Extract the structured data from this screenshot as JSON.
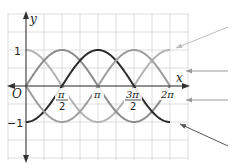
{
  "chart_data": {
    "type": "line",
    "title": "",
    "xlabel": "x",
    "ylabel": "y",
    "origin_label": "O",
    "xlim": [
      -0.7854,
      4.7124
    ],
    "ylim": [
      -2.0,
      2.0
    ],
    "grid": true,
    "legend": "none (unlabeled pointer lines at right)",
    "x_ticks": [
      {
        "value": 1.5708,
        "label_num": "π",
        "label_den": "2"
      },
      {
        "value": 3.1416,
        "label": "π"
      },
      {
        "value": 4.7124,
        "label_num": "3π",
        "label_den": "2"
      },
      {
        "value": 6.2832,
        "label": "2π"
      }
    ],
    "y_ticks": [
      {
        "value": 1,
        "label": "1"
      },
      {
        "value": -1,
        "label": "−1"
      }
    ],
    "series": [
      {
        "name": "cos x",
        "color": "#b3b3b3",
        "x_range": [
          0,
          6.2832
        ],
        "peaks_at": [
          0,
          6.2832
        ],
        "troughs_at": [
          3.1416
        ]
      },
      {
        "name": "sin x",
        "color": "#8c8c8c",
        "x_range": [
          0,
          6.2832
        ],
        "peaks_at": [
          1.5708
        ],
        "troughs_at": [
          4.7124
        ]
      },
      {
        "name": "−cos x",
        "color": "#2b2b2b",
        "x_range": [
          0,
          6.2832
        ],
        "peaks_at": [
          3.1416
        ],
        "troughs_at": [
          0,
          6.2832
        ]
      },
      {
        "name": "−sin x",
        "color": "#9e9e9e",
        "x_range": [
          0,
          6.2832
        ],
        "peaks_at": [
          4.7124
        ],
        "troughs_at": [
          1.5708
        ]
      }
    ],
    "pointers": [
      {
        "target_series": "cos x",
        "from": [
          228,
          27
        ],
        "to": [
          176,
          48
        ],
        "color": "#bdbdbd"
      },
      {
        "target_series": "sin x",
        "from": [
          228,
          71
        ],
        "to": [
          186,
          71
        ],
        "color": "#9a9a9a"
      },
      {
        "target_series": "−sin x",
        "from": [
          228,
          100
        ],
        "to": [
          186,
          100
        ],
        "color": "#9a9a9a"
      },
      {
        "target_series": "−cos x",
        "from": [
          228,
          146
        ],
        "to": [
          180,
          124
        ],
        "color": "#555555"
      }
    ]
  },
  "axes": {
    "x_label": "x",
    "y_label": "y",
    "origin": "O",
    "y_tick_1": "1",
    "y_tick_neg1": "−1",
    "x_tick_pi_over_2_num": "π",
    "x_tick_pi_over_2_den": "2",
    "x_tick_pi": "π",
    "x_tick_3pi_over_2_num": "3π",
    "x_tick_3pi_over_2_den": "2",
    "x_tick_2pi": "2π"
  },
  "colors": {
    "grid": "#d6d6d6",
    "axis": "#333333"
  }
}
